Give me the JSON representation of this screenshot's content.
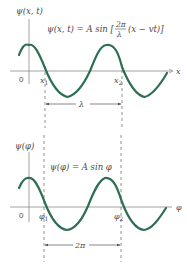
{
  "top_panel": {
    "y_axis_label": "ψ(x, t)",
    "equation": {
      "lhs": "ψ(x, t) = A sin [",
      "frac_num": "2π",
      "frac_den": "λ",
      "rhs": "(x − vt)]"
    },
    "origin_label": "0",
    "x_axis_label": "x",
    "marker_1": "x",
    "marker_1_sub": "1",
    "marker_2": "x",
    "marker_2_sub": "2",
    "span_label": "λ"
  },
  "bottom_panel": {
    "y_axis_label": "ψ(φ)",
    "equation": "ψ(φ) = A sin φ",
    "origin_label": "0",
    "x_axis_label": "φ",
    "marker_1": "φ",
    "marker_1_sub": "1",
    "marker_2": "φ",
    "marker_2_sub": "2",
    "span_label": "2π"
  },
  "colors": {
    "wave": "#2e6e52",
    "axis": "#8a8a8a",
    "text": "#4a4a4a"
  }
}
